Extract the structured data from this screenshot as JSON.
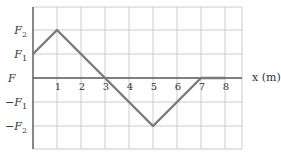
{
  "chart_data": {
    "type": "line",
    "title": "",
    "xlabel": "x (m)",
    "ylabel": "F",
    "x": [
      0,
      1,
      3,
      5,
      7,
      8
    ],
    "series": [
      {
        "name": "F(x)",
        "values": [
          "F1",
          "F2",
          0,
          "-F2",
          0,
          0
        ]
      }
    ],
    "y_numeric_levels": {
      "F2": 2,
      "F1": 1,
      "0": 0,
      "-F1": -1,
      "-F2": -2
    },
    "x_ticks": [
      "1",
      "2",
      "3",
      "4",
      "5",
      "6",
      "7",
      "8"
    ],
    "y_ticks": [
      {
        "label": "F",
        "sub": "2",
        "sign": "",
        "value": 2
      },
      {
        "label": "F",
        "sub": "1",
        "sign": "",
        "value": 1
      },
      {
        "label": "F",
        "sub": "1",
        "sign": "−",
        "value": -1
      },
      {
        "label": "F",
        "sub": "2",
        "sign": "−",
        "value": -2
      }
    ],
    "xlim": [
      0,
      9
    ],
    "ylim": [
      -3,
      3
    ],
    "grid": true,
    "legend": "none"
  },
  "colors": {
    "grid": "#cccccc",
    "axis": "#555555",
    "line": "#7a7a7a"
  }
}
